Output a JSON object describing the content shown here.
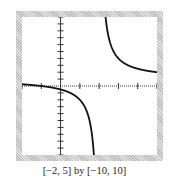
{
  "chart_data": {
    "type": "line",
    "title": "",
    "caption": "[−2, 5] by [−10, 10]",
    "function": "y = (x + 1) / (x - 2)",
    "xlim": [
      -2,
      5
    ],
    "ylim": [
      -10,
      10
    ],
    "x_tick_step": 1,
    "y_tick_step": 1,
    "vertical_asymptote": 2,
    "horizontal_asymptote": 1,
    "series": [
      {
        "name": "left branch",
        "x": [
          -2,
          -1,
          0,
          1,
          1.5,
          1.75
        ],
        "y": [
          0.25,
          0,
          -0.5,
          -2,
          -5,
          -11
        ]
      },
      {
        "name": "right branch",
        "x": [
          2.33,
          2.5,
          3,
          4,
          5
        ],
        "y": [
          10,
          7,
          4,
          2.5,
          2
        ]
      }
    ],
    "xlabel": "",
    "ylabel": "",
    "grid": false,
    "legend": null
  },
  "colors": {
    "curve": "#111111",
    "axis": "#333333",
    "frame_dark": "#bdbdbd",
    "frame_light": "#e2e2e2"
  }
}
